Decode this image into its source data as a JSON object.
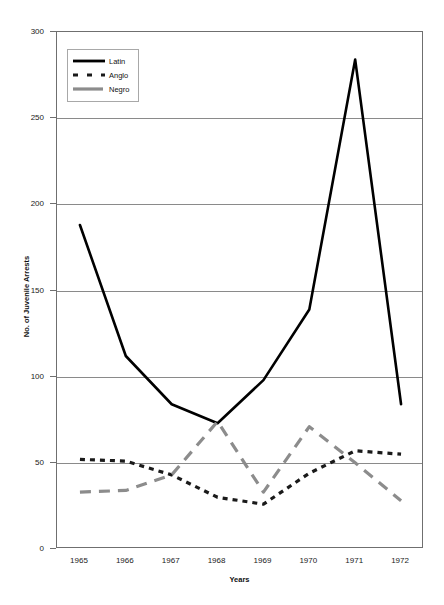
{
  "chart_data": {
    "type": "line",
    "title": "",
    "xlabel": "Years",
    "ylabel": "No. of Juvenile Arrests",
    "categories": [
      "1965",
      "1966",
      "1967",
      "1968",
      "1969",
      "1970",
      "1971",
      "1972"
    ],
    "ylim": [
      0,
      300
    ],
    "y_ticks": [
      0,
      50,
      100,
      150,
      200,
      250,
      300
    ],
    "grid": true,
    "legend_position": "top-left inside plot",
    "series": [
      {
        "name": "Latin",
        "style": "solid",
        "color": "#000000",
        "values": [
          188,
          112,
          84,
          73,
          98,
          139,
          284,
          84
        ]
      },
      {
        "name": "Anglo",
        "style": "dotted",
        "color": "#1a1a1a",
        "values": [
          52,
          51,
          43,
          30,
          26,
          44,
          57,
          55
        ]
      },
      {
        "name": "Negro",
        "style": "dashed",
        "color": "#8c8c8c",
        "values": [
          33,
          34,
          43,
          74,
          33,
          71,
          50,
          28
        ]
      }
    ]
  },
  "axis": {
    "y_tick_labels": [
      "300",
      "250",
      "200",
      "150",
      "100",
      "50",
      "0"
    ],
    "y_title": "No. of Juvenile Arrests",
    "x_title": "Years",
    "x_tick_labels": [
      "1965",
      "1966",
      "1967",
      "1968",
      "1969",
      "1970",
      "1971",
      "1972"
    ]
  },
  "legend": {
    "items": [
      {
        "label": "Latin",
        "swatch": "solid-line-swatch"
      },
      {
        "label": "Anglo",
        "swatch": "dotted-line-swatch"
      },
      {
        "label": "Negro",
        "swatch": "dashed-line-swatch"
      }
    ]
  }
}
